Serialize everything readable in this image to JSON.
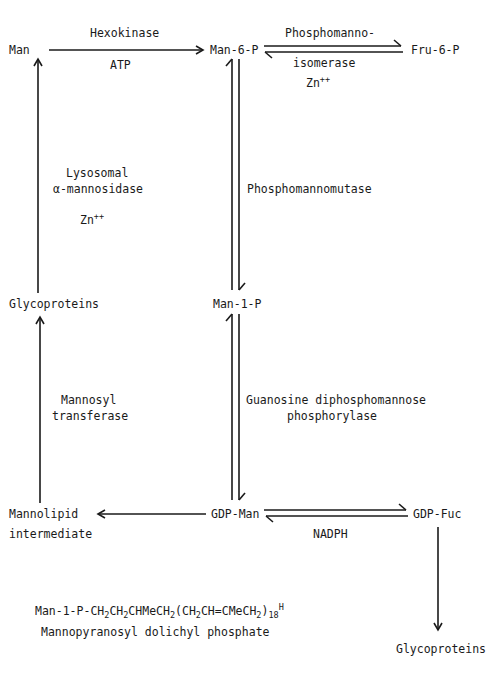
{
  "nodes": {
    "man": "Man",
    "man6p": "Man-6-P",
    "fru6p": "Fru-6-P",
    "glycoproteins_left": "Glycoproteins",
    "man1p": "Man-1-P",
    "mannolipid_line1": "Mannolipid",
    "mannolipid_line2": "intermediate",
    "gdpman": "GDP-Man",
    "gdpfuc": "GDP-Fuc",
    "glycoproteins_bottom": "Glycoproteins"
  },
  "edges": {
    "hexokinase": {
      "enzyme": "Hexokinase",
      "cofactor": "ATP"
    },
    "isomerase": {
      "enzyme_line1": "Phosphomanno-",
      "enzyme_line2": "isomerase",
      "cofactor": "Zn",
      "cofactor_sup": "++"
    },
    "mutase": {
      "enzyme": "Phosphomannomutase"
    },
    "mannosidase": {
      "enzyme_line1": "Lysosomal",
      "enzyme_line2": "α-mannosidase",
      "cofactor": "Zn",
      "cofactor_sup": "++"
    },
    "phosphorylase": {
      "enzyme_line1": "Guanosine diphosphomannose",
      "enzyme_line2": "phosphorylase"
    },
    "transferase": {
      "enzyme_line1": "Mannosyl",
      "enzyme_line2": "transferase"
    },
    "fucose": {
      "cofactor": "NADPH"
    }
  },
  "formula": {
    "parts": [
      "Man-1-P-CH",
      "2",
      "CH",
      "2",
      "CHMeCH",
      "2",
      "(CH",
      "2",
      "CH=CMeCH",
      "2",
      ")",
      "18",
      "H"
    ],
    "caption": "Mannopyranosyl dolichyl phosphate"
  },
  "colors": {
    "ink": "#1a1a1a",
    "background": "#ffffff"
  }
}
